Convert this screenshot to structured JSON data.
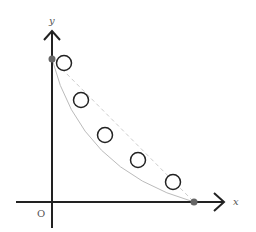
{
  "diagram": {
    "type": "coordinate-plot",
    "axes": {
      "x_label": "x",
      "y_label": "y",
      "origin_label": "O",
      "color": "#222222"
    },
    "endpoints": [
      {
        "name": "y-intercept",
        "cx": 52,
        "cy": 59
      },
      {
        "name": "x-intercept",
        "cx": 194,
        "cy": 202
      }
    ],
    "endpoint_color": "#666666",
    "curve_color": "#bbbbbb",
    "chord_color": "#cccccc",
    "circles": [
      {
        "cx": 64,
        "cy": 63
      },
      {
        "cx": 81,
        "cy": 100
      },
      {
        "cx": 105,
        "cy": 135
      },
      {
        "cx": 138,
        "cy": 160
      },
      {
        "cx": 173,
        "cy": 182
      }
    ],
    "circle_radius": 7.5,
    "circle_stroke": "#222222"
  }
}
